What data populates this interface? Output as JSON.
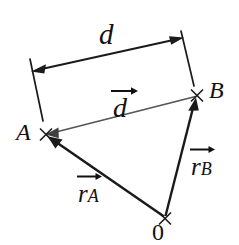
{
  "figure": {
    "background_color": "#ffffff",
    "width": 239,
    "height": 245
  },
  "colors": {
    "stroke_black": "#1a1a1a",
    "stroke_gray": "#555555",
    "text": "#111111"
  },
  "points": [
    {
      "id": "A",
      "label": "A",
      "x": 46,
      "y": 134,
      "marker": "x-cross"
    },
    {
      "id": "B",
      "label": "B",
      "x": 197,
      "y": 95,
      "marker": "x-cross"
    },
    {
      "id": "O",
      "label": "0",
      "x": 165,
      "y": 218,
      "marker": "x-cross"
    }
  ],
  "labels": {
    "scalar_d": "d",
    "vector_d": "d",
    "vector_r_a_base": "r",
    "vector_r_a_sub": "A",
    "vector_r_b_base": "r",
    "vector_r_b_sub": "B",
    "point_a": "A",
    "point_b": "B",
    "point_o": "0"
  },
  "vectors": [
    {
      "name": "d",
      "from_point": "B",
      "to_point": "A",
      "color": "#555555",
      "width": 1.6,
      "arrow_at": "A",
      "label": "d"
    },
    {
      "name": "r_A",
      "from_point": "O",
      "to_point": "A",
      "color": "#1a1a1a",
      "width": 2.4,
      "arrow_at": "A",
      "label": "r_A"
    },
    {
      "name": "r_B",
      "from_point": "O",
      "to_point": "B",
      "color": "#1a1a1a",
      "width": 2.4,
      "arrow_at": "B",
      "label": "r_B"
    }
  ],
  "dimension": {
    "label": "d",
    "style": "double-headed-arrow-with-extension-lines",
    "line_from": {
      "x": 33,
      "y": 71
    },
    "line_to": {
      "x": 182,
      "y": 38
    },
    "extension_left_from": {
      "x": 30,
      "y": 59
    },
    "extension_left_to": {
      "x": 43,
      "y": 121
    },
    "extension_right_from": {
      "x": 181,
      "y": 31
    },
    "extension_right_to": {
      "x": 194,
      "y": 86
    },
    "color": "#1a1a1a"
  }
}
